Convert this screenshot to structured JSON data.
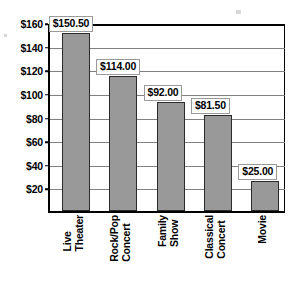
{
  "chart_data": {
    "type": "bar",
    "title": "",
    "subtitle": "",
    "xlabel": "",
    "ylabel": "",
    "categories": [
      "Live Theater",
      "Rock/Pop Concert",
      "Family Show",
      "Classical Concert",
      "Movie"
    ],
    "category_lines": [
      [
        "Live",
        "Theater"
      ],
      [
        "Rock/Pop",
        "Concert"
      ],
      [
        "Family",
        "Show"
      ],
      [
        "Classical",
        "Concert"
      ],
      [
        "Movie"
      ]
    ],
    "values": [
      150.5,
      114.0,
      92.0,
      81.5,
      25.0
    ],
    "value_labels": [
      "$150.50",
      "$114.00",
      "$92.00",
      "$81.50",
      "$25.00"
    ],
    "ylim": [
      0,
      160
    ],
    "ytick_values": [
      160,
      140,
      120,
      100,
      80,
      60,
      40,
      20
    ],
    "ytick_labels": [
      "$160",
      "$140",
      "$120",
      "$100",
      "$80",
      "$60",
      "$40",
      "$20"
    ],
    "grid": true,
    "legend": false,
    "legend_position": "none",
    "bar_color": "#999999",
    "bar_edge_color": "#2b2b2b",
    "gridline_color": "#808080",
    "axis_color": "#000000",
    "label_box_background": "#ffffff",
    "label_box_border": "#9a9a9a",
    "background": "#ffffff"
  }
}
